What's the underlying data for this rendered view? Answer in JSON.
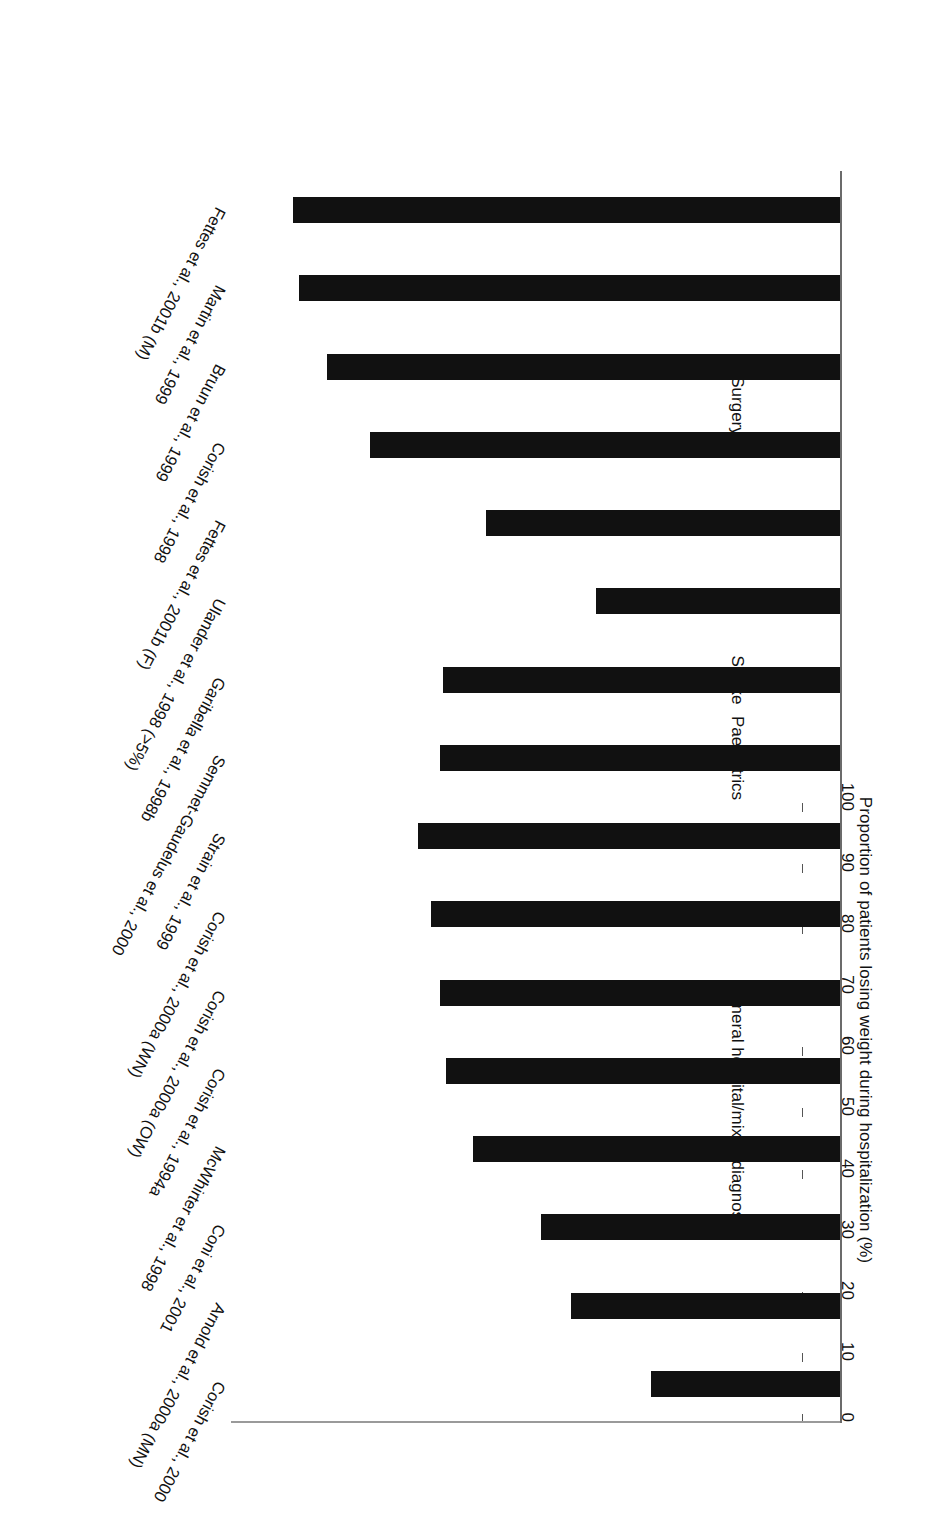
{
  "figure": {
    "orientation": "rotated-180",
    "background": "#ffffff",
    "bar_color": "#111111",
    "axis_color": "#6b6b6b"
  },
  "chart_data": {
    "type": "bar",
    "orientation": "horizontal",
    "title": "",
    "subtitle": "",
    "xlabel": "",
    "ylabel": "Proportion of patients losing weight during hospitalization (%)",
    "ylim": [
      0,
      100
    ],
    "tick_labels": [
      "0",
      "10",
      "20",
      "30",
      "40",
      "50",
      "60",
      "70",
      "80",
      "90",
      "100"
    ],
    "ticks": [
      0,
      10,
      20,
      30,
      40,
      50,
      60,
      70,
      80,
      90,
      100
    ],
    "grid": false,
    "legend": null,
    "legend_position": "none",
    "categories": [
      "Corish et al., 2000",
      "Arnold et al., 2000a (MN)",
      "Coni et al., 2001",
      "McWhirter et al., 1998",
      "Corish et al., 1994a",
      "Corish et al., 2000a (OW)",
      "Corish et al., 2000a (WN)",
      "Strain et al., 1999",
      "Semmet-Gaudelus et al., 2000",
      "Garibella et al., 1998b",
      "Ulander et al., 1998 (>5%)",
      "Fettes et al., 2001b (F)",
      "Corish et al., 1998",
      "Bruun et al., 1999",
      "Martin et al., 1999",
      "Fettes et al., 2001b (M)"
    ],
    "values": [
      31,
      44,
      49,
      60,
      64.5,
      65.5,
      67,
      69,
      65.5,
      65,
      40,
      58,
      77,
      84,
      88.5,
      89.5
    ],
    "groups": [
      {
        "label": "General hospital/mixed diagnoses",
        "start_index": 0,
        "end_index": 7
      },
      {
        "label": "Paediatrics",
        "start_index": 8,
        "end_index": 8
      },
      {
        "label": "Stroke",
        "start_index": 9,
        "end_index": 9
      },
      {
        "label": "Surgery",
        "start_index": 10,
        "end_index": 15
      }
    ]
  }
}
